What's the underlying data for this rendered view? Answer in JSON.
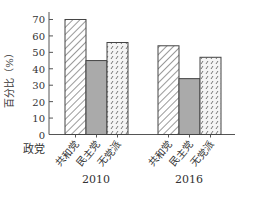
{
  "chart_data": {
    "type": "bar",
    "title": "",
    "xlabel": "政党",
    "ylabel": "百分比（%）",
    "ylim": [
      0,
      70
    ],
    "yticks": [
      0,
      10,
      20,
      30,
      40,
      50,
      60,
      70
    ],
    "grid": false,
    "legend": null,
    "groups": [
      "2010",
      "2016"
    ],
    "categories": [
      "共和党",
      "民主党",
      "无党派"
    ],
    "series": [
      {
        "name": "2010",
        "values": [
          70,
          45,
          56
        ]
      },
      {
        "name": "2016",
        "values": [
          54,
          34,
          47
        ]
      }
    ],
    "styles": [
      {
        "category": "共和党",
        "fill": "diagonal-hatch",
        "color": "#ffffff",
        "stroke": "#444444"
      },
      {
        "category": "民主党",
        "fill": "solid",
        "color": "#aaaaaa",
        "stroke": "#444444"
      },
      {
        "category": "无党派",
        "fill": "dotted-dash",
        "color": "#ffffff",
        "stroke": "#444444"
      }
    ]
  },
  "labels": {
    "ylabel": "百分比（%）",
    "xlabel": "政党",
    "group_2010": "2010",
    "group_2016": "2016",
    "cat_r": "共和党",
    "cat_d": "民主党",
    "cat_i": "无党派",
    "ticks": [
      "0",
      "10",
      "20",
      "30",
      "40",
      "50",
      "60",
      "70"
    ]
  }
}
